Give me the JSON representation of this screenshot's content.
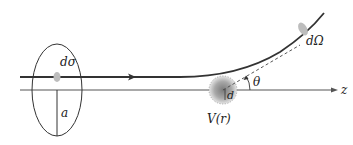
{
  "diagram": {
    "type": "scattering-geometry",
    "labels": {
      "cross_section": "dσ",
      "impact_parameter": "a",
      "solid_angle": "dΩ",
      "angle": "θ",
      "potential": "V(r)",
      "range": "d",
      "axis": "z"
    },
    "colors": {
      "line": "#333333",
      "axis": "#555555",
      "blob": "#bdbdbd",
      "sphere_center": "#7a7a7a",
      "background": "#ffffff"
    }
  }
}
